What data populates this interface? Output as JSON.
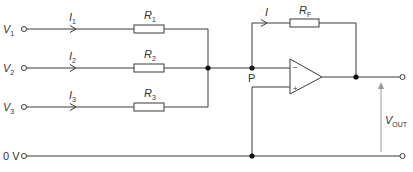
{
  "diagram": {
    "type": "summing-amplifier-circuit",
    "inputs": [
      {
        "voltage_label": "V",
        "voltage_sub": "1",
        "current_label": "I",
        "current_sub": "1",
        "resistor_label": "R",
        "resistor_sub": "1"
      },
      {
        "voltage_label": "V",
        "voltage_sub": "2",
        "current_label": "I",
        "current_sub": "2",
        "resistor_label": "R",
        "resistor_sub": "2"
      },
      {
        "voltage_label": "V",
        "voltage_sub": "3",
        "current_label": "I",
        "current_sub": "3",
        "resistor_label": "R",
        "resistor_sub": "3"
      }
    ],
    "feedback": {
      "current_label": "I",
      "resistor_label": "R",
      "resistor_sub": "F"
    },
    "node_label": "P",
    "opamp": {
      "inverting_sign": "−",
      "noninverting_sign": "+"
    },
    "ground_label": "0 V",
    "output": {
      "label": "V",
      "label_sub": "OUT"
    },
    "colors": {
      "wire": "#3a3a3a",
      "junction": "#111111",
      "vout_arrow": "#9a9a9a"
    }
  }
}
